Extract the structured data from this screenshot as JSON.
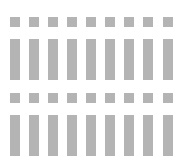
{
  "layout": {
    "columns": 9,
    "column_x": [
      10,
      29,
      48,
      67,
      86,
      105,
      124,
      143,
      163
    ],
    "groups": [
      {
        "square_y": 17,
        "bar_y": 39
      },
      {
        "square_y": 93,
        "bar_y": 115
      }
    ]
  },
  "colors": {
    "background": "#ffffff",
    "block": "#b4b4b4"
  }
}
